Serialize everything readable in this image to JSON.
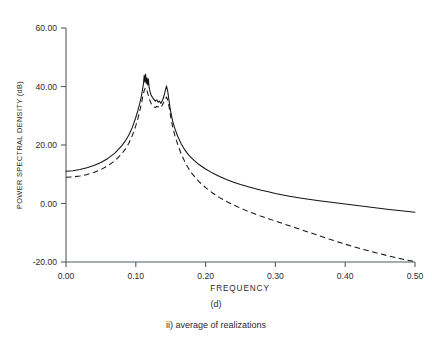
{
  "figure": {
    "caption_panel": "(d)",
    "caption_sub": "ii) average of realizations"
  },
  "chart_data": {
    "type": "line",
    "title": "",
    "xlabel": "FREQUENCY",
    "ylabel": "POWER SPECTRAL DENSITY (dB)",
    "xlim": [
      0.0,
      0.5
    ],
    "ylim": [
      -20.0,
      60.0
    ],
    "xticks": [
      0.0,
      0.1,
      0.2,
      0.3,
      0.4,
      0.5
    ],
    "xticklabels": [
      "0.00",
      "0.10",
      "0.20",
      "0.30",
      "0.40",
      "0.50"
    ],
    "yticks": [
      -20.0,
      0.0,
      20.0,
      40.0,
      60.0
    ],
    "yticklabels": [
      "-20.00",
      "0.00",
      "20.00",
      "40.00",
      "60.00"
    ],
    "grid": false,
    "legend": "none",
    "series": [
      {
        "name": "solid-estimate",
        "style": "solid",
        "color": "#141414",
        "x": [
          0.0,
          0.01,
          0.02,
          0.03,
          0.04,
          0.05,
          0.06,
          0.07,
          0.08,
          0.085,
          0.09,
          0.095,
          0.1,
          0.103,
          0.106,
          0.108,
          0.11,
          0.111,
          0.112,
          0.113,
          0.114,
          0.115,
          0.116,
          0.117,
          0.118,
          0.119,
          0.12,
          0.122,
          0.124,
          0.126,
          0.128,
          0.13,
          0.132,
          0.134,
          0.136,
          0.138,
          0.14,
          0.142,
          0.144,
          0.146,
          0.148,
          0.15,
          0.153,
          0.156,
          0.16,
          0.165,
          0.17,
          0.175,
          0.18,
          0.19,
          0.2,
          0.21,
          0.22,
          0.23,
          0.24,
          0.25,
          0.26,
          0.27,
          0.28,
          0.29,
          0.3,
          0.32,
          0.34,
          0.36,
          0.38,
          0.4,
          0.42,
          0.44,
          0.46,
          0.48,
          0.5
        ],
        "y": [
          11.0,
          11.2,
          11.6,
          12.2,
          13.0,
          14.0,
          15.4,
          17.2,
          19.8,
          21.4,
          23.4,
          26.0,
          29.4,
          31.8,
          34.6,
          36.6,
          39.5,
          41.0,
          43.8,
          41.5,
          44.3,
          41.0,
          43.0,
          40.5,
          42.6,
          39.8,
          38.6,
          37.0,
          36.2,
          35.6,
          35.0,
          35.4,
          34.6,
          35.0,
          34.2,
          35.2,
          36.4,
          38.4,
          40.2,
          38.0,
          34.5,
          31.4,
          28.0,
          25.6,
          23.0,
          20.4,
          18.4,
          16.8,
          15.5,
          13.4,
          11.8,
          10.4,
          9.2,
          8.2,
          7.3,
          6.5,
          5.8,
          5.1,
          4.5,
          4.0,
          3.4,
          2.5,
          1.7,
          1.0,
          0.4,
          -0.2,
          -0.8,
          -1.4,
          -2.0,
          -2.5,
          -3.0
        ]
      },
      {
        "name": "dashed-estimate",
        "style": "dashed",
        "color": "#141414",
        "x": [
          0.0,
          0.01,
          0.02,
          0.03,
          0.04,
          0.05,
          0.06,
          0.07,
          0.08,
          0.085,
          0.09,
          0.095,
          0.1,
          0.103,
          0.106,
          0.108,
          0.11,
          0.112,
          0.114,
          0.116,
          0.118,
          0.12,
          0.122,
          0.124,
          0.126,
          0.128,
          0.13,
          0.132,
          0.134,
          0.136,
          0.138,
          0.14,
          0.142,
          0.144,
          0.146,
          0.148,
          0.15,
          0.153,
          0.156,
          0.16,
          0.165,
          0.17,
          0.175,
          0.18,
          0.19,
          0.2,
          0.21,
          0.22,
          0.23,
          0.24,
          0.25,
          0.26,
          0.27,
          0.28,
          0.29,
          0.3,
          0.32,
          0.34,
          0.36,
          0.38,
          0.4,
          0.42,
          0.44,
          0.46,
          0.48,
          0.5
        ],
        "y": [
          9.0,
          9.1,
          9.4,
          9.9,
          10.6,
          11.6,
          12.9,
          14.6,
          17.0,
          18.6,
          20.6,
          23.2,
          26.6,
          29.0,
          32.0,
          34.0,
          36.6,
          38.6,
          39.6,
          38.6,
          37.0,
          35.4,
          34.2,
          33.4,
          33.0,
          32.8,
          33.2,
          33.0,
          33.4,
          33.0,
          33.6,
          34.6,
          35.6,
          36.4,
          35.2,
          32.6,
          29.6,
          26.0,
          23.2,
          20.2,
          17.0,
          14.4,
          12.2,
          10.4,
          7.6,
          5.4,
          3.6,
          2.0,
          0.7,
          -0.5,
          -1.6,
          -2.6,
          -3.5,
          -4.4,
          -5.2,
          -6.0,
          -7.6,
          -9.2,
          -10.8,
          -12.4,
          -13.9,
          -15.3,
          -16.6,
          -17.8,
          -18.9,
          -19.9
        ]
      }
    ]
  }
}
